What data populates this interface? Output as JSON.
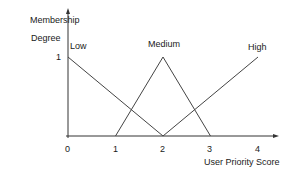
{
  "chart_data": {
    "type": "line",
    "title": "",
    "xlabel": "User Priority Score",
    "ylabel": "Membership Degree",
    "ylabel_lines": [
      "Membership",
      "Degree"
    ],
    "xlim": [
      0,
      4
    ],
    "ylim": [
      0,
      1
    ],
    "x_ticks": [
      "0",
      "1",
      "2",
      "3",
      "4"
    ],
    "y_ticks": [
      "1"
    ],
    "grid": false,
    "legend": "inline labels",
    "series": [
      {
        "name": "Low",
        "x": [
          0,
          2
        ],
        "y": [
          1,
          0
        ]
      },
      {
        "name": "Medium",
        "x": [
          1,
          2,
          3
        ],
        "y": [
          0,
          1,
          0
        ]
      },
      {
        "name": "High",
        "x": [
          2,
          4
        ],
        "y": [
          0,
          1
        ]
      }
    ]
  }
}
